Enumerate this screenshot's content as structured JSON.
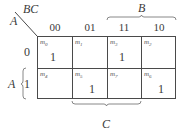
{
  "kmap": {
    "corner": {
      "row_var": "A",
      "col_var": "BC"
    },
    "columns": [
      "00",
      "01",
      "11",
      "10"
    ],
    "rows": [
      "0",
      "1"
    ],
    "cells": [
      [
        {
          "minterm": "m",
          "index": "0",
          "value": "1"
        },
        {
          "minterm": "m",
          "index": "1",
          "value": ""
        },
        {
          "minterm": "m",
          "index": "3",
          "value": "1"
        },
        {
          "minterm": "m",
          "index": "2",
          "value": ""
        }
      ],
      [
        {
          "minterm": "m",
          "index": "4",
          "value": ""
        },
        {
          "minterm": "m",
          "index": "5",
          "value": "1"
        },
        {
          "minterm": "m",
          "index": "7",
          "value": ""
        },
        {
          "minterm": "m",
          "index": "6",
          "value": "1"
        }
      ]
    ],
    "braces": {
      "top": {
        "label": "B",
        "spans": [
          "11",
          "10"
        ]
      },
      "bottom": {
        "label": "C",
        "spans": [
          "01",
          "11"
        ]
      },
      "left": {
        "label": "A",
        "spans": [
          "1"
        ]
      }
    },
    "colors": {
      "line": "#4a4a4a",
      "text": "#3a3a3a"
    }
  }
}
